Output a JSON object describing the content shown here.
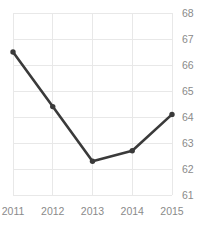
{
  "chart_data": {
    "type": "line",
    "title": "",
    "xlabel": "",
    "ylabel": "",
    "categories": [
      "2011",
      "2012",
      "2013",
      "2014",
      "2015"
    ],
    "x": [
      2011,
      2012,
      2013,
      2014,
      2015
    ],
    "values": [
      66.5,
      64.4,
      62.3,
      62.7,
      64.1
    ],
    "series": [
      {
        "name": "series-1",
        "values": [
          66.5,
          64.4,
          62.3,
          62.7,
          64.1
        ],
        "color": "#3a3a3a",
        "marker": "circle"
      }
    ],
    "ylim": [
      61,
      68
    ],
    "yticks": [
      61,
      62,
      63,
      64,
      65,
      66,
      67,
      68
    ],
    "ytick_labels": [
      "61",
      "62",
      "63",
      "64",
      "65",
      "66",
      "67",
      "68"
    ],
    "xticks": [
      2011,
      2012,
      2013,
      2014,
      2015
    ],
    "xtick_labels": [
      "2011",
      "2012",
      "2013",
      "2014",
      "2015"
    ],
    "y_axis_position": "right",
    "grid": true,
    "grid_color": "#e8e8e8",
    "legend": false,
    "legend_position": "none",
    "annotations": []
  },
  "style": {
    "background": "#ffffff",
    "line_color": "#3a3a3a",
    "tick_label_color": "#8a8a8a",
    "grid_color": "#e8e8e8",
    "title_color": "#f0f0f0"
  }
}
